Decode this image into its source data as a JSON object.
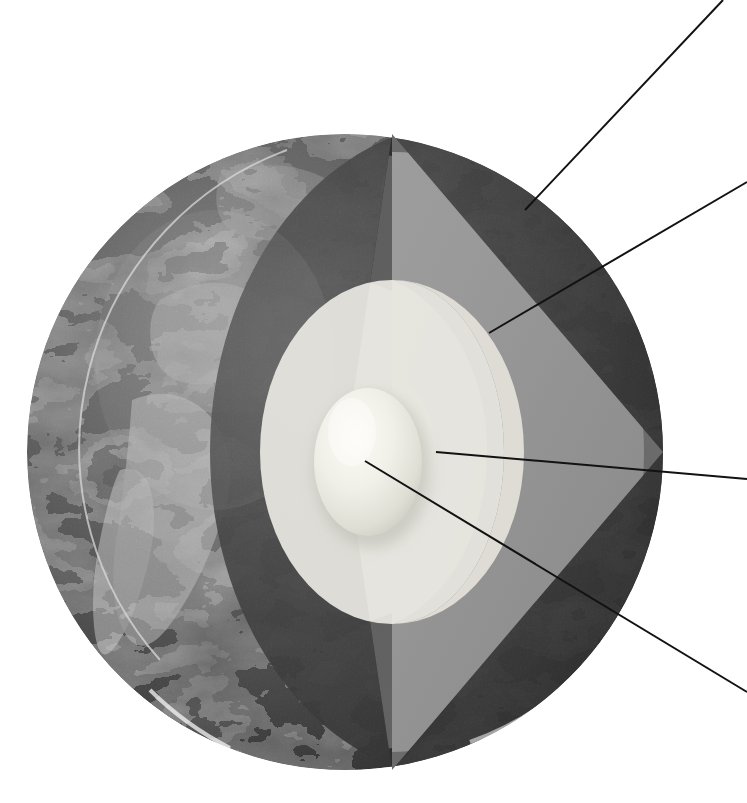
{
  "figure": {
    "kind": "cutaway-sphere-diagram",
    "background_color": "#ffffff",
    "visible_text": "",
    "note": "No text labels are rendered in the screenshot; only leader lines pointing off-frame."
  },
  "globe": {
    "center_x": 345,
    "center_y": 452,
    "radius": 318,
    "left_edge_x": 28,
    "right_edge_x": 663,
    "top_edge_y": 133,
    "bottom_edge_y": 770,
    "surface_description": "Grayscale satellite Earth texture, Americas facing viewer",
    "cut_vertex_x": 392
  },
  "layers": [
    {
      "id": "crust",
      "name": "Crust",
      "color": "#3b3b3b",
      "edge_color": "#2a2a2a",
      "order": 1,
      "kind": "outer-shell"
    },
    {
      "id": "mantle",
      "name": "Mantle",
      "color": "#9a9a9a",
      "shadow_color": "#6f6f6f",
      "order": 2,
      "kind": "shell"
    },
    {
      "id": "outer-core",
      "name": "Outer core",
      "color": "#dcdbd4",
      "shadow_color": "#b4b3ac",
      "order": 3,
      "kind": "shell"
    },
    {
      "id": "inner-core",
      "name": "Inner core",
      "color": "#f2f1e9",
      "shadow_color": "#c9c8bf",
      "order": 4,
      "kind": "solid-ellipsoid"
    }
  ],
  "cut_faces": [
    {
      "id": "left-cut-face",
      "name": "Left cut face (shaded)",
      "shade": "#5d5d5d"
    },
    {
      "id": "right-cut-face",
      "name": "Right cut face (lit)",
      "shade": "#9a9a9a"
    }
  ],
  "leaders": [
    {
      "id": "leader-crust",
      "target_layer": "crust",
      "label": "",
      "x1": 525,
      "y1": 210,
      "x2": 723,
      "y2": 0
    },
    {
      "id": "leader-mantle",
      "target_layer": "mantle",
      "label": "",
      "x1": 489,
      "y1": 333,
      "x2": 747,
      "y2": 182
    },
    {
      "id": "leader-outer-core",
      "target_layer": "outer-core",
      "label": "",
      "x1": 436,
      "y1": 452,
      "x2": 747,
      "y2": 479
    },
    {
      "id": "leader-inner-core",
      "target_layer": "inner-core",
      "label": "",
      "x1": 365,
      "y1": 461,
      "x2": 747,
      "y2": 692
    }
  ],
  "colors": {
    "background": "#ffffff",
    "leader_line": "#121212",
    "crust": "#3b3b3b",
    "mantle": "#9a9a9a",
    "outer_core": "#dcdbd4",
    "inner_core": "#f2f1e9"
  }
}
